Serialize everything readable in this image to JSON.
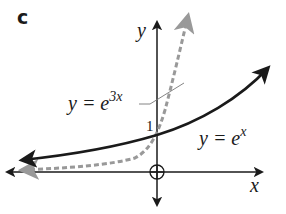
{
  "figure": {
    "part_label": "c",
    "axes": {
      "x_label": "x",
      "y_label": "y",
      "origin_marker": "circle-cross"
    },
    "y_intercept_label": "1",
    "curves": [
      {
        "name": "y = e^x",
        "label_base": "y = e",
        "label_exp": "x",
        "style": "solid",
        "color": "#1a1a1a"
      },
      {
        "name": "y = e^3x",
        "label_base": "y = e",
        "label_exp": "3x",
        "style": "dashed",
        "color": "#999999"
      }
    ]
  }
}
